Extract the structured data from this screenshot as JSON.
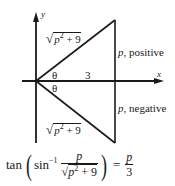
{
  "diagram": {
    "axes": {
      "x_label": "x",
      "y_label": "y"
    },
    "upper_triangle": {
      "hypotenuse_label_root": "√",
      "hypotenuse_label_inner_p": "p",
      "hypotenuse_label_inner_exp": "2",
      "hypotenuse_label_inner_rest": " + 9",
      "angle_label": "θ",
      "adjacent_label": "3",
      "opposite_label_var": "p",
      "opposite_label_text": ", positive"
    },
    "lower_triangle": {
      "hypotenuse_label_root": "√",
      "hypotenuse_label_inner_p": "p",
      "hypotenuse_label_inner_exp": "2",
      "hypotenuse_label_inner_rest": " + 9",
      "angle_label": "θ",
      "opposite_label_var": "p",
      "opposite_label_text": ", negative"
    },
    "stroke_color": "#1a1a1a"
  },
  "formula": {
    "func": "tan",
    "open_paren": "(",
    "inner_func": "sin",
    "inner_exp": "−1",
    "frac_num": "p",
    "frac_den_root": "√",
    "frac_den_p": "p",
    "frac_den_exp": "2",
    "frac_den_rest": " + 9",
    "close_paren": ")",
    "equals": "=",
    "rhs_num": "p",
    "rhs_den": "3"
  }
}
